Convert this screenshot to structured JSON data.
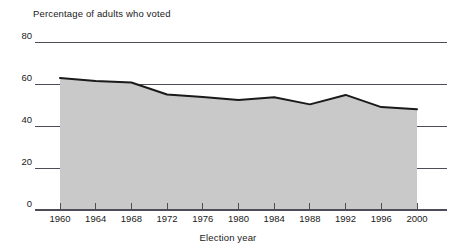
{
  "chart_data": {
    "type": "area",
    "title": "",
    "ylabel": "Percentage of adults who voted",
    "xlabel": "Election year",
    "categories": [
      "1960",
      "1964",
      "1968",
      "1972",
      "1976",
      "1980",
      "1984",
      "1988",
      "1992",
      "1996",
      "2000"
    ],
    "x": [
      1960,
      1964,
      1968,
      1972,
      1976,
      1980,
      1984,
      1988,
      1992,
      1996,
      2000
    ],
    "values": [
      62.8,
      61.4,
      60.7,
      55.0,
      53.8,
      52.4,
      53.7,
      50.3,
      54.8,
      49.0,
      48.0
    ],
    "ylim": [
      0,
      80
    ],
    "yticks": [
      0,
      20,
      40,
      60,
      80
    ],
    "ytick_labels": [
      "0",
      "20",
      "40",
      "60",
      "80"
    ],
    "xlim": [
      1960,
      2000
    ],
    "grid": true,
    "grid_axis": "y",
    "legend": null,
    "series": [
      {
        "name": "Percentage of adults who voted",
        "values": [
          62.8,
          61.4,
          60.7,
          55.0,
          53.8,
          52.4,
          53.7,
          50.3,
          54.8,
          49.0,
          48.0
        ]
      }
    ],
    "colors": {
      "area_fill": "#c9c9c9",
      "line": "#1a1a1a",
      "axis": "#4d4d5a",
      "grid": "#4d4d5a",
      "text": "#1a1a1a",
      "background": "#ffffff"
    }
  }
}
